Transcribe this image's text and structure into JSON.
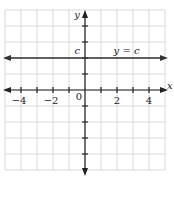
{
  "chart_data": {
    "type": "line",
    "title": "",
    "xlabel": "x",
    "ylabel": "y",
    "xlim": [
      -5,
      5
    ],
    "ylim": [
      -5,
      5
    ],
    "grid": true,
    "x_ticks": [
      -4,
      -3,
      -2,
      -1,
      1,
      2,
      3,
      4
    ],
    "y_ticks": [
      -4,
      -3,
      -2,
      -1,
      1,
      2,
      3,
      4
    ],
    "x_tick_labels": [
      {
        "value": -4,
        "label": "−4"
      },
      {
        "value": -2,
        "label": "−2"
      },
      {
        "value": 2,
        "label": "2"
      },
      {
        "value": 4,
        "label": "4"
      }
    ],
    "origin_label": "0",
    "series": [
      {
        "name": "y = c",
        "type": "horizontal-line",
        "y": 2,
        "label": "y = c"
      }
    ],
    "annotations": [
      {
        "text": "c",
        "x": -0.4,
        "y": 2,
        "meaning": "y-intercept value c"
      }
    ]
  }
}
